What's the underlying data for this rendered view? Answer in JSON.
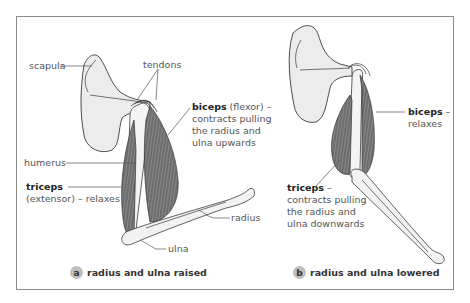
{
  "panel_a": {
    "labels": {
      "scapula": "scapula",
      "tendons": "tendons",
      "biceps_title": "biceps",
      "biceps_rest": " (flexor) –",
      "biceps_line2": "contracts pulling",
      "biceps_line3": "the radius and",
      "biceps_line4": "ulna upwards",
      "humerus": "humerus",
      "triceps_title": "triceps",
      "triceps_line2": "(extensor) – relaxes",
      "radius": "radius",
      "ulna": "ulna"
    },
    "caption_badge": "a",
    "caption": "radius and ulna raised"
  },
  "panel_b": {
    "labels": {
      "biceps_title": "biceps",
      "biceps_rest": " –",
      "biceps_line2": "relaxes",
      "triceps_title": "triceps",
      "triceps_rest": " –",
      "triceps_line2": "contracts pulling",
      "triceps_line3": "the radius and",
      "triceps_line4": "ulna downwards"
    },
    "caption_badge": "b",
    "caption": "radius and ulna lowered"
  },
  "colors": {
    "bone_fill": "#ededed",
    "muscle_fill": "#6f6f6f",
    "outline": "#3a3a3a",
    "frame": "#8a8a8a",
    "badge": "#bdbdbd"
  }
}
